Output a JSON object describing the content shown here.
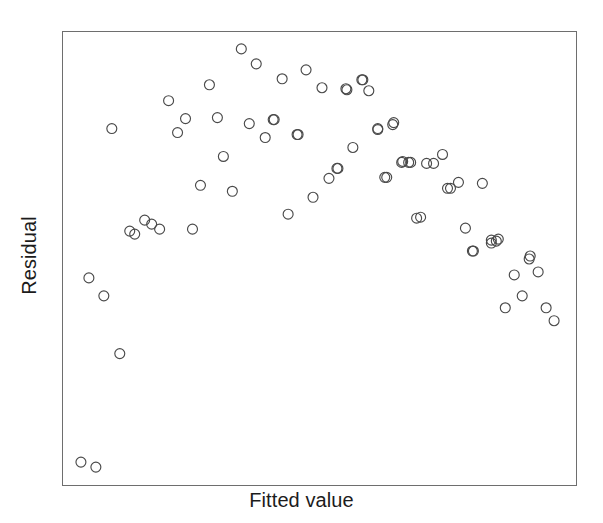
{
  "chart_data": {
    "type": "scatter",
    "title": "",
    "subtitle": "",
    "xlabel": "Fitted value",
    "ylabel": "Residual",
    "xlim": [
      0,
      1
    ],
    "ylim": [
      0,
      1
    ],
    "grid": false,
    "legend": null,
    "axis_ticks": {
      "x": [],
      "y": []
    },
    "marker": {
      "shape": "open-circle",
      "radius_px": 5,
      "edge_color": "#4a4a4a",
      "fill": "none"
    },
    "frame": {
      "left_px": 62,
      "top_px": 31,
      "width_px": 515,
      "height_px": 455,
      "border_color": "#6e6e6e"
    },
    "n_points": 75,
    "note": "Residuals vs fitted values showing a strong inverted-U (curvature) pattern; two extreme low outliers at lower left.",
    "points_px": [
      [
        80,
        463
      ],
      [
        95,
        468
      ],
      [
        88,
        278
      ],
      [
        103,
        296
      ],
      [
        119,
        354
      ],
      [
        111,
        128
      ],
      [
        129,
        231
      ],
      [
        134,
        234
      ],
      [
        144,
        220
      ],
      [
        151,
        224
      ],
      [
        159,
        229
      ],
      [
        168,
        100
      ],
      [
        177,
        132
      ],
      [
        185,
        118
      ],
      [
        192,
        229
      ],
      [
        200,
        185
      ],
      [
        209,
        84
      ],
      [
        217,
        117
      ],
      [
        223,
        156
      ],
      [
        232,
        191
      ],
      [
        241,
        48
      ],
      [
        249,
        123
      ],
      [
        256,
        63
      ],
      [
        265,
        137
      ],
      [
        273,
        119
      ],
      [
        274,
        119
      ],
      [
        282,
        78
      ],
      [
        288,
        214
      ],
      [
        297,
        134
      ],
      [
        298,
        134
      ],
      [
        306,
        69
      ],
      [
        313,
        197
      ],
      [
        322,
        87
      ],
      [
        329,
        178
      ],
      [
        337,
        168
      ],
      [
        346,
        88
      ],
      [
        353,
        147
      ],
      [
        363,
        79
      ],
      [
        369,
        90
      ],
      [
        378,
        128
      ],
      [
        385,
        177
      ],
      [
        394,
        122
      ],
      [
        402,
        162
      ],
      [
        409,
        162
      ],
      [
        417,
        218
      ],
      [
        421,
        217
      ],
      [
        427,
        163
      ],
      [
        434,
        163
      ],
      [
        443,
        154
      ],
      [
        448,
        188
      ],
      [
        451,
        188
      ],
      [
        459,
        182
      ],
      [
        466,
        228
      ],
      [
        473,
        251
      ],
      [
        483,
        183
      ],
      [
        492,
        243
      ],
      [
        497,
        241
      ],
      [
        506,
        308
      ],
      [
        515,
        275
      ],
      [
        523,
        296
      ],
      [
        530,
        259
      ],
      [
        539,
        272
      ],
      [
        547,
        308
      ],
      [
        555,
        321
      ],
      [
        531,
        256
      ],
      [
        499,
        239
      ],
      [
        492,
        240
      ],
      [
        474,
        251
      ],
      [
        403,
        161
      ],
      [
        411,
        162
      ],
      [
        347,
        89
      ],
      [
        362,
        79
      ],
      [
        378,
        129
      ],
      [
        393,
        124
      ],
      [
        338,
        168
      ],
      [
        387,
        177
      ]
    ],
    "x": [
      0.035,
      0.064,
      0.05,
      0.08,
      0.111,
      0.095,
      0.13,
      0.14,
      0.159,
      0.173,
      0.188,
      0.206,
      0.223,
      0.239,
      0.252,
      0.268,
      0.285,
      0.301,
      0.313,
      0.33,
      0.347,
      0.363,
      0.377,
      0.394,
      0.41,
      0.412,
      0.427,
      0.439,
      0.456,
      0.458,
      0.474,
      0.487,
      0.505,
      0.518,
      0.534,
      0.551,
      0.565,
      0.584,
      0.596,
      0.614,
      0.627,
      0.645,
      0.66,
      0.674,
      0.689,
      0.697,
      0.709,
      0.722,
      0.74,
      0.75,
      0.755,
      0.771,
      0.785,
      0.798,
      0.818,
      0.835,
      0.843,
      0.862,
      0.879,
      0.895,
      0.908,
      0.926,
      0.942,
      0.957,
      0.911,
      0.849,
      0.835,
      0.8,
      0.662,
      0.678,
      0.553,
      0.583,
      0.613,
      0.643,
      0.536,
      0.631
    ],
    "y": [
      0.051,
      0.04,
      0.457,
      0.418,
      0.29,
      0.718,
      0.56,
      0.554,
      0.585,
      0.575,
      0.564,
      0.848,
      0.778,
      0.809,
      0.564,
      0.661,
      0.882,
      0.81,
      0.725,
      0.648,
      0.941,
      0.776,
      0.908,
      0.766,
      0.806,
      0.806,
      0.896,
      0.598,
      0.763,
      0.763,
      0.918,
      0.636,
      0.877,
      0.677,
      0.699,
      0.875,
      0.745,
      0.893,
      0.869,
      0.787,
      0.679,
      0.801,
      0.713,
      0.713,
      0.589,
      0.591,
      0.71,
      0.71,
      0.73,
      0.655,
      0.655,
      0.668,
      0.58,
      0.529,
      0.664,
      0.547,
      0.551,
      0.392,
      0.464,
      0.418,
      0.498,
      0.47,
      0.392,
      0.363,
      0.504,
      0.539,
      0.542,
      0.529,
      0.784,
      0.782,
      0.873,
      0.895,
      0.785,
      0.796,
      0.787,
      0.676
    ]
  },
  "axis": {
    "x_label": "Fitted value",
    "y_label": "Residual"
  }
}
